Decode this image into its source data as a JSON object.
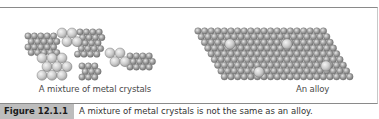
{
  "figure": {
    "panels": [
      {
        "id": "mixture",
        "label": "A mixture of metal crystals"
      },
      {
        "id": "alloy",
        "label": "An alloy"
      }
    ],
    "caption": {
      "tag": "Figure 12.1.1",
      "text": "A mixture of metal crystals is not the same as an alloy."
    }
  },
  "colors": {
    "small_atom": "#9a9a9a",
    "large_atom": "#c9c9c9",
    "frame_border": "#8a8a8a",
    "caption_tag_bg": "#bdbdbd"
  }
}
